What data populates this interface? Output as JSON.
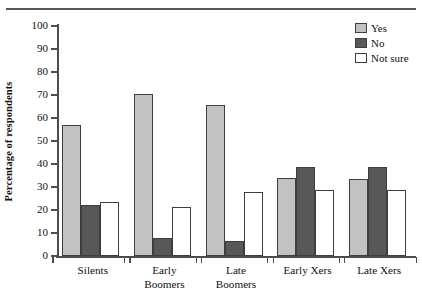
{
  "chart_data": {
    "type": "bar",
    "title": "",
    "subtitle": "",
    "xlabel": "",
    "ylabel": "Percentage of respondents",
    "ylim": [
      0,
      100
    ],
    "yticks": [
      0,
      10,
      20,
      30,
      40,
      50,
      60,
      70,
      80,
      90,
      100
    ],
    "ytick_labels": [
      "0",
      "10",
      "20",
      "30",
      "40",
      "50",
      "60",
      "70",
      "80",
      "90",
      "100"
    ],
    "grid": false,
    "legend_position": "top-right",
    "categories": [
      "Silents",
      "Early Boomers",
      "Late Boomers",
      "Early Xers",
      "Late Xers"
    ],
    "category_labels": [
      "Silents",
      "Early\nBoomers",
      "Late\nBoomers",
      "Early Xers",
      "Late Xers"
    ],
    "series": [
      {
        "name": "Yes",
        "color": "#c2c2c2",
        "values": [
          57.0,
          70.5,
          65.5,
          34.0,
          33.5
        ]
      },
      {
        "name": "No",
        "color": "#585858",
        "values": [
          22.0,
          8.0,
          6.5,
          38.5,
          38.5
        ]
      },
      {
        "name": "Not sure",
        "color": "#ffffff",
        "values": [
          23.5,
          21.5,
          28.0,
          28.5,
          28.5
        ]
      }
    ]
  },
  "legend": {
    "items": [
      {
        "label": "Yes",
        "swatch": "light-gray-swatch"
      },
      {
        "label": "No",
        "swatch": "dark-gray-swatch"
      },
      {
        "label": "Not sure",
        "swatch": "white-swatch"
      }
    ]
  },
  "axes": {
    "y_title": "Percentage of respondents"
  },
  "colors": {
    "yes": "#c2c2c2",
    "no": "#585858",
    "not_sure": "#ffffff",
    "axis": "#4a4e51",
    "rule": "#55595c",
    "text": "#111111",
    "background": "#ffffff"
  }
}
